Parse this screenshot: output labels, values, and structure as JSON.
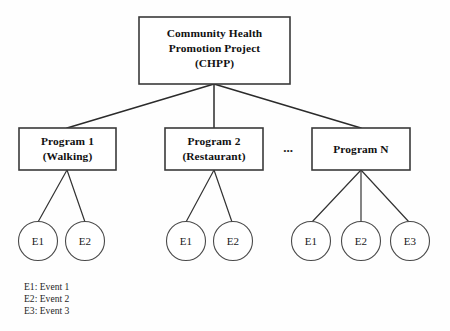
{
  "diagram": {
    "root": {
      "lines": [
        "Community Health",
        "Promotion Project",
        "(CHPP)"
      ]
    },
    "programs": [
      {
        "line1": "Program 1",
        "line2": "(Walking)"
      },
      {
        "line1": "Program 2",
        "line2": "(Restaurant)"
      },
      {
        "line1": "Program N",
        "line2": ""
      }
    ],
    "ellipsis": "...",
    "events": {
      "group1": [
        "E1",
        "E2"
      ],
      "group2": [
        "E1",
        "E2"
      ],
      "group3": [
        "E1",
        "E2",
        "E3"
      ]
    },
    "legend": [
      "E1: Event 1",
      "E2: Event 2",
      "E3: Event 3"
    ],
    "colors": {
      "box_stroke": "#3a3a3a",
      "circle_stroke": "#4a4a4a",
      "edge": "#2b2b2b",
      "text": "#111111",
      "background": "#fefefe"
    }
  }
}
